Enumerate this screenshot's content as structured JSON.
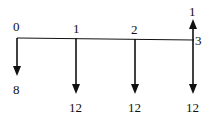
{
  "diagram": {
    "type": "cash-flow-timeline",
    "periods": [
      {
        "label": "0",
        "x": 17,
        "flows": [
          {
            "direction": "down",
            "amount": "8",
            "end_y": 75,
            "label_y": 93
          }
        ]
      },
      {
        "label": "1",
        "x": 76,
        "flows": [
          {
            "direction": "down",
            "amount": "12",
            "end_y": 93,
            "label_y": 111
          }
        ]
      },
      {
        "label": "2",
        "x": 135,
        "flows": [
          {
            "direction": "down",
            "amount": "12",
            "end_y": 93,
            "label_y": 111
          }
        ]
      },
      {
        "label": "3",
        "x": 193,
        "flows": [
          {
            "direction": "up",
            "amount": "1",
            "end_y": 18,
            "label_y": 16
          },
          {
            "direction": "down",
            "amount": "12",
            "end_y": 93,
            "label_y": 111
          }
        ]
      }
    ],
    "line_color": "#111111"
  }
}
